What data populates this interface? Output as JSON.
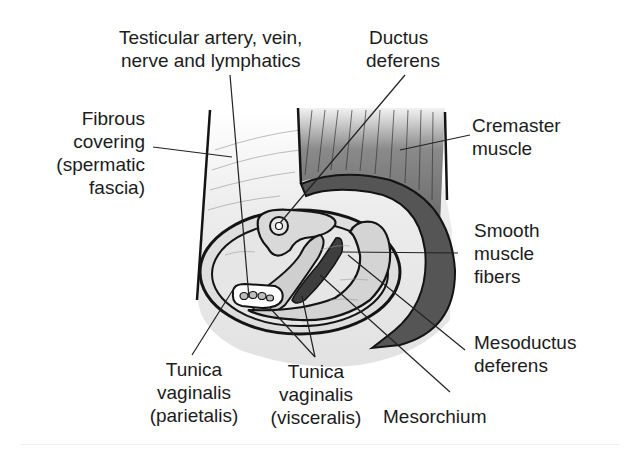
{
  "figure": {
    "colors": {
      "outline": "#141414",
      "fascia_fill": "#e9e9e9",
      "cremaster_fill_top": "#5a5a5a",
      "cremaster_fill_bottom": "#bdbdbd",
      "smooth_muscle_fill": "#4a4a4a",
      "inner_fill": "#d6d6d6",
      "leader_line": "#222222"
    }
  },
  "labels": {
    "testicular": {
      "line1": "Testicular artery, vein,",
      "line2": "nerve and lymphatics"
    },
    "ductus": {
      "line1": "Ductus",
      "line2": "deferens"
    },
    "fibrous": {
      "line1": "Fibrous",
      "line2": "covering",
      "line3": "(spermatic",
      "line4": "fascia)"
    },
    "cremaster": {
      "line1": "Cremaster",
      "line2": "muscle"
    },
    "smooth": {
      "line1": "Smooth",
      "line2": "muscle",
      "line3": "fibers"
    },
    "mesoductus": {
      "line1": "Mesoductus",
      "line2": "deferens"
    },
    "tunica_parietalis": {
      "line1": "Tunica",
      "line2": "vaginalis",
      "line3": "(parietalis)"
    },
    "tunica_visceralis": {
      "line1": "Tunica",
      "line2": "vaginalis",
      "line3": "(visceralis)"
    },
    "mesorchium": {
      "line1": "Mesorchium"
    }
  }
}
